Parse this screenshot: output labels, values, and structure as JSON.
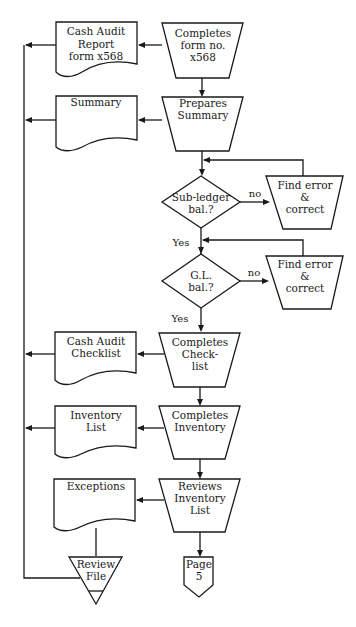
{
  "diagram": {
    "type": "flowchart",
    "processes": [
      {
        "id": "p1",
        "lines": [
          "Completes",
          "form no.",
          "x568"
        ]
      },
      {
        "id": "p2",
        "lines": [
          "Prepares",
          "Summary"
        ]
      },
      {
        "id": "p3",
        "lines": [
          "Completes",
          "Check-",
          "list"
        ]
      },
      {
        "id": "p4",
        "lines": [
          "Completes",
          "Inventory"
        ]
      },
      {
        "id": "p5",
        "lines": [
          "Reviews",
          "Inventory",
          "List"
        ]
      }
    ],
    "documents": [
      {
        "id": "d1",
        "lines": [
          "Cash Audit",
          "Report",
          "form x568"
        ]
      },
      {
        "id": "d2",
        "lines": [
          "Summary"
        ]
      },
      {
        "id": "d3",
        "lines": [
          "Cash Audit",
          "Checklist"
        ]
      },
      {
        "id": "d4",
        "lines": [
          "Inventory",
          "List"
        ]
      },
      {
        "id": "d5",
        "lines": [
          "Exceptions"
        ]
      }
    ],
    "decisions": [
      {
        "id": "q1",
        "lines": [
          "Sub-ledger",
          "bal.?"
        ],
        "yes": "Yes",
        "no": "no"
      },
      {
        "id": "q2",
        "lines": [
          "G.L.",
          "bal.?"
        ],
        "yes": "Yes",
        "no": "no"
      }
    ],
    "corrections": [
      {
        "id": "c1",
        "lines": [
          "Find error",
          "&",
          "correct"
        ]
      },
      {
        "id": "c2",
        "lines": [
          "Find error",
          "&",
          "correct"
        ]
      }
    ],
    "file": {
      "lines": [
        "Review",
        "File"
      ]
    },
    "offpage": {
      "lines": [
        "Page",
        "5"
      ]
    }
  }
}
